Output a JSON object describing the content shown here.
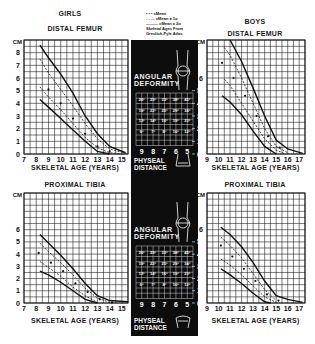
{
  "legend": {
    "mean": "• • • =Mean",
    "one_sd": "- - - - =Mean ± 1σ",
    "two_sd": "——— =Mean ± 2σ",
    "note_line1": "Skeletal Ages From",
    "note_line2": "Greulich-Pyle Atlas"
  },
  "center_panel": {
    "angular_deformity_label_1": "ANGULAR",
    "angular_deformity_label_2": "DEFORMITY",
    "physeal_distance_label_1": "PHYSEAL",
    "physeal_distance_label_2": "DISTANCE",
    "distance_axis_cm": [
      "9",
      "8",
      "7",
      "6",
      "5"
    ],
    "right_axis_cm": [
      "5",
      "4",
      "3",
      "2",
      "1",
      "0"
    ],
    "femur_table": [
      [
        "26°",
        "29°",
        "33°",
        "38°",
        "45°"
      ],
      [
        "19°",
        "22°",
        "25°",
        "29°",
        "34°"
      ],
      [
        "13°",
        "14°",
        "16°",
        "19°",
        "23°"
      ],
      [
        "6°",
        "7°",
        "8°",
        "10°",
        "12°"
      ]
    ],
    "tibia_table": [
      [
        "26°",
        "29°",
        "33°",
        "38°",
        "45°"
      ],
      [
        "19°",
        "22°",
        "25°",
        "29°",
        "34°"
      ],
      [
        "13°",
        "14°",
        "16°",
        "19°",
        "23°"
      ],
      [
        "6°",
        "7°",
        "8°",
        "10°",
        "12°"
      ]
    ]
  },
  "headings": {
    "girls": "GIRLS",
    "boys": "BOYS"
  },
  "chart_data": [
    {
      "type": "line",
      "title": "GIRLS — DISTAL FEMUR",
      "xlabel": "SKELETAL AGE (YEARS)",
      "ylabel": "CM",
      "xlim": [
        7,
        15.5
      ],
      "ylim": [
        0,
        9
      ],
      "x_ticks": [
        "7",
        "8",
        "9",
        "10",
        "11",
        "12",
        "13",
        "14",
        "15"
      ],
      "y_ticks": [
        "0",
        "1",
        "2",
        "3",
        "4",
        "5",
        "6",
        "7",
        "8"
      ],
      "grid": true,
      "mean_points": [
        [
          9,
          5.1
        ],
        [
          10,
          4.0
        ],
        [
          11,
          2.8
        ],
        [
          12,
          1.6
        ],
        [
          13,
          0.6
        ],
        [
          14,
          0.2
        ]
      ],
      "series": [
        {
          "name": "Mean + 2σ",
          "x": [
            8.3,
            9,
            10,
            11,
            12,
            13,
            14,
            15.3
          ],
          "y": [
            8.6,
            7.6,
            6.3,
            4.8,
            3.0,
            1.6,
            0.6,
            0.1
          ]
        },
        {
          "name": "Mean + 1σ",
          "x": [
            8.3,
            9,
            10,
            11,
            12,
            13,
            14,
            15.3
          ],
          "y": [
            7.5,
            6.4,
            5.1,
            3.8,
            2.4,
            1.2,
            0.4,
            0.05
          ]
        },
        {
          "name": "Mean - 1σ",
          "x": [
            8.3,
            9,
            10,
            11,
            12,
            13,
            14,
            15
          ],
          "y": [
            5.3,
            4.5,
            3.5,
            2.4,
            1.3,
            0.5,
            0.1,
            0
          ]
        },
        {
          "name": "Mean - 2σ",
          "x": [
            8.3,
            9,
            10,
            11,
            12,
            13,
            14
          ],
          "y": [
            4.3,
            3.7,
            2.8,
            1.9,
            1.0,
            0.2,
            0
          ]
        }
      ]
    },
    {
      "type": "line",
      "title": "BOYS — DISTAL FEMUR",
      "xlabel": "SKELETAL AGE (YEARS)",
      "ylabel": "CM",
      "xlim": [
        9,
        17.5
      ],
      "ylim": [
        0,
        9
      ],
      "x_ticks": [
        "9",
        "10",
        "11",
        "12",
        "13",
        "14",
        "15",
        "16",
        "17"
      ],
      "y_ticks": [
        "0",
        "1",
        "2",
        "3",
        "4",
        "5",
        "6"
      ],
      "grid": true,
      "mean_points": [
        [
          10.3,
          7.2
        ],
        [
          11.3,
          6.0
        ],
        [
          12.3,
          4.6
        ],
        [
          13.3,
          3.0
        ],
        [
          14.3,
          1.4
        ],
        [
          15.3,
          0.5
        ]
      ],
      "series": [
        {
          "name": "Mean + 2σ",
          "x": [
            11,
            12,
            13,
            14,
            15,
            16,
            17.3
          ],
          "y": [
            9,
            7.3,
            5.2,
            3.0,
            1.1,
            0.4,
            0.05
          ]
        },
        {
          "name": "Mean + 1σ",
          "x": [
            10.5,
            11,
            12,
            13,
            14,
            15,
            16
          ],
          "y": [
            8.4,
            7.8,
            6.0,
            4.0,
            2.0,
            0.6,
            0.1
          ]
        },
        {
          "name": "Mean - 1σ",
          "x": [
            10.5,
            11,
            12,
            13,
            14,
            15,
            15.8
          ],
          "y": [
            5.9,
            5.4,
            4.0,
            2.6,
            1.2,
            0.3,
            0
          ]
        },
        {
          "name": "Mean - 2σ",
          "x": [
            10.3,
            11,
            12,
            13,
            14,
            15
          ],
          "y": [
            4.6,
            4.1,
            3.1,
            1.8,
            0.6,
            0
          ]
        }
      ]
    },
    {
      "type": "line",
      "title": "GIRLS — PROXIMAL TIBIA",
      "xlabel": "SKELETAL AGE (YEARS)",
      "ylabel": "CM",
      "xlim": [
        7,
        15.5
      ],
      "ylim": [
        0,
        9
      ],
      "x_ticks": [
        "7",
        "8",
        "9",
        "10",
        "11",
        "12",
        "13",
        "14",
        "15"
      ],
      "y_ticks": [
        "0",
        "1",
        "2",
        "3",
        "4",
        "5",
        "6"
      ],
      "grid": true,
      "mean_points": [
        [
          8.2,
          4.1
        ],
        [
          9.2,
          3.3
        ],
        [
          10.2,
          2.6
        ],
        [
          11.2,
          1.6
        ],
        [
          12.2,
          0.9
        ],
        [
          13.2,
          0.3
        ],
        [
          14.2,
          0.05
        ]
      ],
      "series": [
        {
          "name": "Mean + 2σ",
          "x": [
            8.3,
            9,
            10,
            11,
            12,
            13,
            14,
            15.5
          ],
          "y": [
            5.6,
            4.9,
            3.9,
            2.8,
            1.6,
            0.6,
            0.2,
            0.1
          ]
        },
        {
          "name": "Mean + 1σ",
          "x": [
            8.3,
            9,
            10,
            11,
            12,
            13,
            14
          ],
          "y": [
            4.9,
            4.2,
            3.3,
            2.3,
            1.2,
            0.4,
            0.05
          ]
        },
        {
          "name": "Mean - 1σ",
          "x": [
            8.3,
            9,
            10,
            11,
            12,
            13
          ],
          "y": [
            3.4,
            2.9,
            2.2,
            1.3,
            0.6,
            0.05
          ]
        },
        {
          "name": "Mean - 2σ",
          "x": [
            8.3,
            9,
            10,
            11,
            12,
            13
          ],
          "y": [
            2.6,
            2.3,
            1.7,
            1.0,
            0.3,
            0
          ]
        }
      ]
    },
    {
      "type": "line",
      "title": "BOYS — PROXIMAL TIBIA",
      "xlabel": "SKELETAL AGE (YEARS)",
      "ylabel": "CM",
      "xlim": [
        9,
        17.5
      ],
      "ylim": [
        0,
        9
      ],
      "x_ticks": [
        "9",
        "10",
        "11",
        "12",
        "13",
        "14",
        "15",
        "16",
        "17"
      ],
      "y_ticks": [
        "0",
        "1",
        "2",
        "3",
        "4",
        "5",
        "6"
      ],
      "grid": true,
      "mean_points": [
        [
          10.2,
          4.7
        ],
        [
          11.2,
          3.8
        ],
        [
          12.2,
          2.8
        ],
        [
          13.2,
          1.8
        ],
        [
          14.2,
          0.7
        ],
        [
          15.2,
          0.2
        ]
      ],
      "series": [
        {
          "name": "Mean + 2σ",
          "x": [
            10.2,
            11,
            12,
            13,
            14,
            15,
            16,
            17.3
          ],
          "y": [
            6.2,
            5.6,
            4.6,
            3.3,
            1.8,
            0.6,
            0.3,
            0.05
          ]
        },
        {
          "name": "Mean + 1σ",
          "x": [
            10.2,
            11,
            12,
            13,
            14,
            15
          ],
          "y": [
            5.4,
            4.7,
            3.7,
            2.4,
            1.1,
            0.2
          ]
        },
        {
          "name": "Mean - 1σ",
          "x": [
            10.2,
            11,
            12,
            13,
            14,
            15
          ],
          "y": [
            3.6,
            3.1,
            2.3,
            1.4,
            0.5,
            0.05
          ]
        },
        {
          "name": "Mean - 2σ",
          "x": [
            10.2,
            11,
            12,
            13,
            14,
            14.5
          ],
          "y": [
            2.8,
            2.3,
            1.6,
            0.8,
            0.1,
            0
          ]
        }
      ]
    }
  ]
}
